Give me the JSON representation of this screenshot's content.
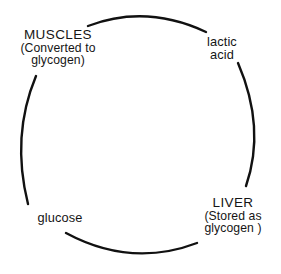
{
  "diagram": {
    "type": "cycle-diagram",
    "background_color": "#ffffff",
    "stroke_color": "#111111",
    "text_color": "#151515",
    "nodes": {
      "muscles": {
        "head": "MUSCLES",
        "sub_line1": "(Converted to",
        "sub_line2": "glycogen)"
      },
      "lactic_acid": {
        "head": "lactic",
        "sub_line1": "acid",
        "sub_line2": ""
      },
      "liver": {
        "head": "LIVER",
        "sub_line1": "(Stored as",
        "sub_line2": "glycogen )"
      },
      "glucose": {
        "head": "glucose",
        "sub_line1": "",
        "sub_line2": ""
      }
    }
  }
}
